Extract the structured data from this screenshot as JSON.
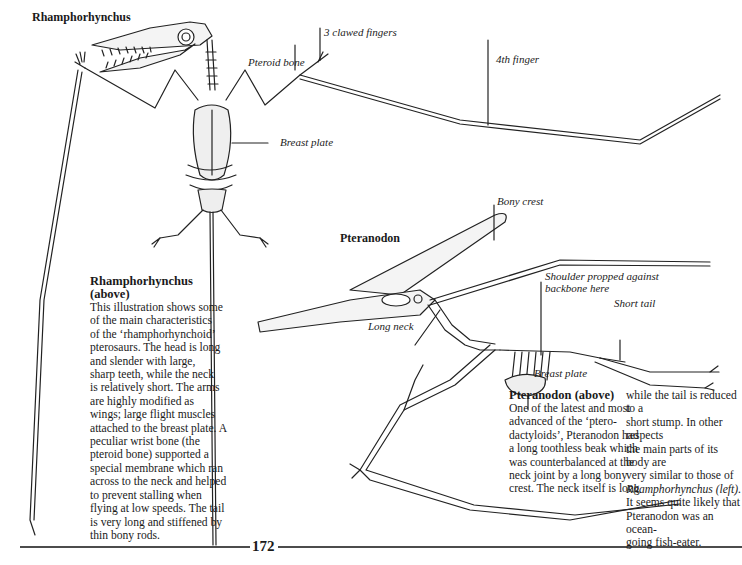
{
  "page": {
    "number": "172"
  },
  "rhamphorhynchus": {
    "heading": "Rhamphorhynchus",
    "labels": {
      "claws": "3 clawed fingers",
      "pteroid": "Pteroid bone",
      "fourth_finger": "4th finger",
      "breast_plate": "Breast plate"
    },
    "caption": {
      "title_line1": "Rhamphorhynchus",
      "title_line2": "(above)",
      "lines": [
        "This illustration shows some",
        "of the main characteristics",
        "of the ‘rhamphorhynchoid’",
        "pterosaurs. The head is long",
        "and slender with large,",
        "sharp teeth, while the neck",
        "is relatively short. The arms",
        "are highly modified as",
        "wings; large flight muscles",
        "attached to the breast plate. A",
        "peculiar wrist bone (the",
        "pteroid bone) supported a",
        "special membrane which ran",
        "across to the neck and helped",
        "to prevent stalling when",
        "flying at low speeds. The tail",
        "is very long and stiffened by",
        "thin bony rods."
      ]
    }
  },
  "pteranodon": {
    "heading": "Pteranodon",
    "labels": {
      "crest": "Bony crest",
      "shoulder_line1": "Shoulder propped against",
      "shoulder_line2": "backbone here",
      "short_tail": "Short tail",
      "long_neck": "Long neck",
      "breast_plate": "Breast plate"
    },
    "caption": {
      "title": "Pteranodon (above)",
      "col1": [
        "One of the latest and most",
        "advanced of the ‘ptero-",
        "dactyloids’, Pteranodon had",
        "a long toothless beak which",
        "was counterbalanced at the",
        "neck joint by a long bony",
        "crest. The neck itself is long"
      ],
      "col2": [
        "while the tail is reduced to a",
        "short stump. In other respects",
        "the main parts of its body are",
        "very similar to those of",
        "Rhamphorhynchus (left).",
        "It seems quite likely that",
        "Pteranodon was an ocean-",
        "going fish-eater."
      ]
    }
  }
}
